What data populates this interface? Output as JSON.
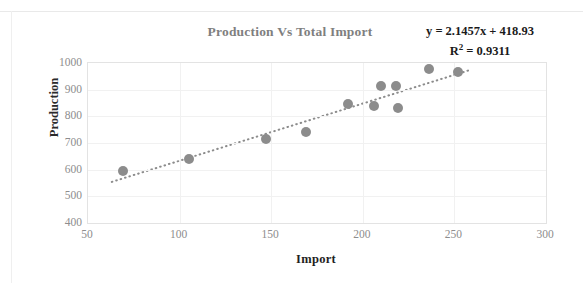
{
  "chart_data": {
    "type": "scatter",
    "title": "Production Vs Total Import",
    "xlabel": "Import",
    "ylabel": "Production",
    "xlim": [
      50,
      300
    ],
    "ylim": [
      400,
      1000
    ],
    "xticks": [
      50,
      100,
      150,
      200,
      250,
      300
    ],
    "yticks": [
      400,
      500,
      600,
      700,
      800,
      900,
      1000
    ],
    "grid": true,
    "legend": "none",
    "marker_color": "#8c8c8c",
    "trendline_color": "#8c8c8c",
    "title_color": "#7f7f7f",
    "annotations": {
      "equation": "y = 2.1457x + 418.93",
      "r_squared_prefix": "R",
      "r_squared_exponent": "2",
      "r_squared_value": " = 0.9311"
    },
    "series": [
      {
        "name": "Production vs Import",
        "points": [
          {
            "x": 69,
            "y": 595
          },
          {
            "x": 105,
            "y": 640
          },
          {
            "x": 147,
            "y": 715
          },
          {
            "x": 169,
            "y": 742
          },
          {
            "x": 192,
            "y": 846
          },
          {
            "x": 206,
            "y": 838
          },
          {
            "x": 210,
            "y": 912
          },
          {
            "x": 218,
            "y": 915
          },
          {
            "x": 219,
            "y": 830
          },
          {
            "x": 236,
            "y": 977
          },
          {
            "x": 252,
            "y": 966
          }
        ]
      }
    ],
    "trendline": {
      "type": "linear",
      "slope": 2.1457,
      "intercept": 418.93,
      "r_squared": 0.9311,
      "style": "dotted",
      "x_start": 63,
      "x_end": 258
    }
  }
}
